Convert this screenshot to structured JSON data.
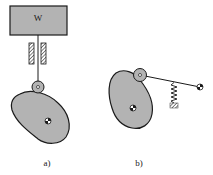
{
  "diagram": {
    "type": "cam-follower mechanisms",
    "panels": [
      {
        "id": "a",
        "label": "a)",
        "components": {
          "weight_label": "W",
          "parts": [
            "weight block",
            "follower rod",
            "linear guide",
            "roller follower",
            "cam",
            "cam pivot"
          ]
        }
      },
      {
        "id": "b",
        "label": "b)",
        "components": {
          "parts": [
            "cam",
            "cam pivot",
            "roller follower",
            "oscillating lever arm",
            "return spring",
            "lever pivot"
          ]
        }
      }
    ]
  },
  "colors": {
    "fill_gray": "#b3b3b3",
    "stroke": "#1a1a1a",
    "background": "#ffffff"
  }
}
